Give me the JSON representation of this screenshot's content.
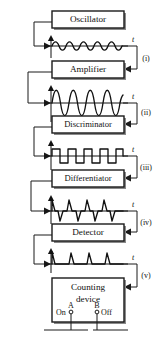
{
  "figure": {
    "type": "block-diagram",
    "width": 162,
    "height": 340,
    "background": "#ffffff",
    "line_color": "#1a1a1a",
    "text_color": "#111111"
  },
  "blocks": [
    {
      "id": "oscillator",
      "label": "Oscillator",
      "order": 1
    },
    {
      "id": "amplifier",
      "label": "Amplifier",
      "order": 2
    },
    {
      "id": "discriminator",
      "label": "Discriminator",
      "order": 3
    },
    {
      "id": "differentiator",
      "label": "Differentiator",
      "order": 4
    },
    {
      "id": "detector",
      "label": "Detector",
      "order": 5
    },
    {
      "id": "counting-device",
      "label_line1": "Counting",
      "label_line2": "device",
      "order": 6
    }
  ],
  "waveforms": [
    {
      "id": "wave-sine-small",
      "stage_label": "(i)",
      "axis_label": "t",
      "shape": "sine",
      "cycles": 4.5,
      "amplitude": "small",
      "description": "low amplitude sinusoidal signal from oscillator"
    },
    {
      "id": "wave-sine-large",
      "stage_label": "(ii)",
      "axis_label": "t",
      "shape": "sine",
      "cycles": 4.5,
      "amplitude": "large",
      "description": "amplified high amplitude sinusoidal signal"
    },
    {
      "id": "wave-square",
      "stage_label": "(iii)",
      "axis_label": "t",
      "shape": "square",
      "cycles": 4.5,
      "amplitude": "medium",
      "description": "square wave produced by the discriminator"
    },
    {
      "id": "wave-spikes-bipolar",
      "stage_label": "(iv)",
      "axis_label": "t",
      "shape": "bipolar-spikes",
      "cycles": 4.5,
      "amplitude": "medium",
      "description": "alternating positive and negative spikes from differentiator"
    },
    {
      "id": "wave-spikes-unipolar",
      "stage_label": "(v)",
      "axis_label": "t",
      "shape": "unipolar-spikes",
      "cycles": 4.5,
      "amplitude": "medium",
      "description": "positive-only spikes after detection"
    }
  ],
  "terminals": {
    "left_switch_label": "On",
    "left_terminal_label": "A",
    "right_terminal_label": "B",
    "right_switch_label": "Off"
  }
}
